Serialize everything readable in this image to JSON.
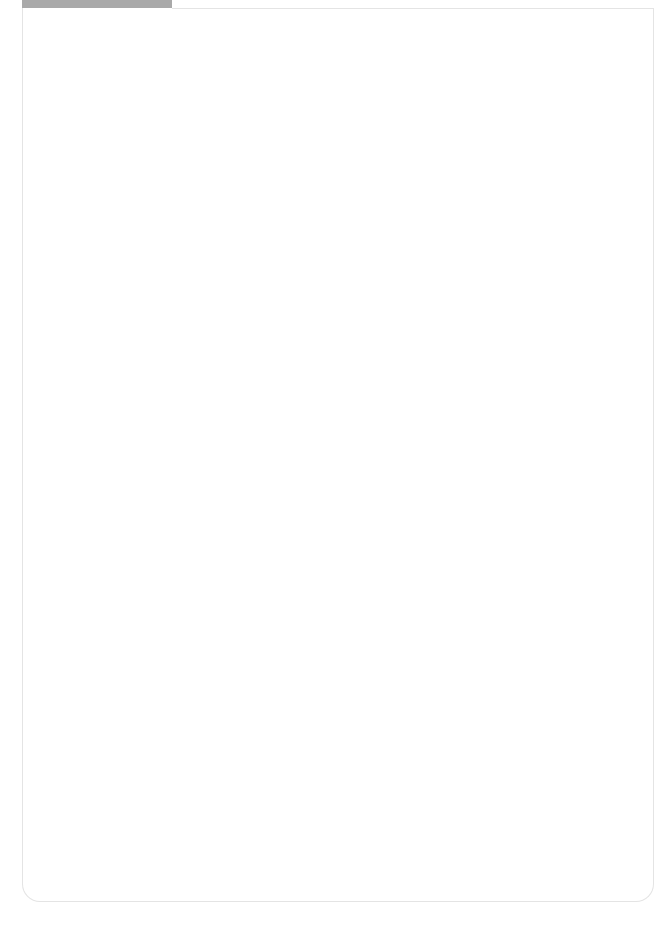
{
  "page": {
    "number": "2",
    "stitch_count_label": "142코"
  },
  "colors": {
    "cell_fill": "#c2c2c2",
    "grid_line": "#6d6d6d",
    "tab": "#a9a9a9",
    "frame": "#e4e4e4",
    "rib_mark": "#222222"
  },
  "chart": {
    "arrows": [
      {
        "direction": "up",
        "x": 601
      },
      {
        "direction": "down",
        "x": 630
      },
      {
        "direction": "down",
        "x": 654
      }
    ],
    "legend": {
      "rib_symbol": "I",
      "decrease_symbol": "⋌",
      "edge_dot": "•"
    }
  }
}
